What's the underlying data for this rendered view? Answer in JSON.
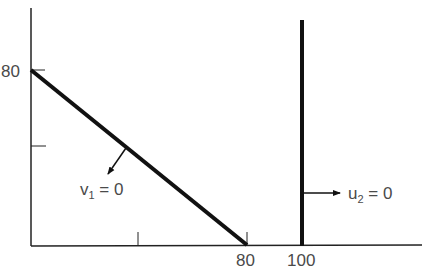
{
  "diagram": {
    "type": "constraint-plot",
    "y_axis": {
      "ticks": [
        {
          "label": "80",
          "value": 80
        },
        {
          "label": "",
          "value": 40
        }
      ],
      "label_80": "80"
    },
    "x_axis": {
      "ticks": [
        {
          "label": "",
          "value": 40
        },
        {
          "label": "80",
          "value": 80
        },
        {
          "label": "100",
          "value": 100
        }
      ],
      "label_80": "80",
      "label_100": "100"
    },
    "lines": [
      {
        "name": "v1-constraint",
        "from": [
          0,
          80
        ],
        "to": [
          80,
          0
        ],
        "label": "v",
        "subscript": "1",
        "equals": " = 0",
        "arrow_direction": "down-left"
      },
      {
        "name": "u2-constraint",
        "x": 100,
        "label": "u",
        "subscript": "2",
        "equals": " = 0",
        "arrow_direction": "right"
      }
    ],
    "colors": {
      "line": "#111111",
      "text": "#4a4a4a"
    }
  }
}
